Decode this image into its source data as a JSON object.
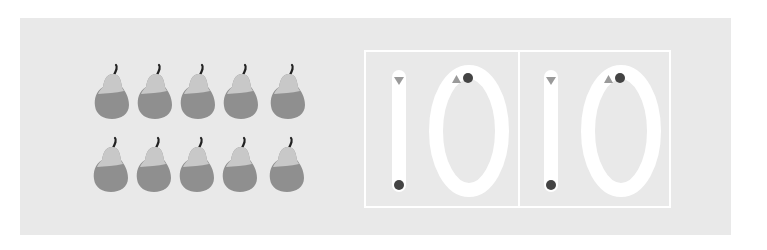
{
  "activity": {
    "type": "counting-and-tracing-worksheet",
    "object_name": "pear",
    "count": 10,
    "rows": 2,
    "per_row": 5,
    "trace_number": "10",
    "trace_cells": [
      {
        "digits": [
          "1",
          "0"
        ]
      },
      {
        "digits": [
          "1",
          "0"
        ]
      }
    ]
  },
  "colors": {
    "background": "#ffffff",
    "panel": "#e9e9e9",
    "trace_stroke": "#ffffff",
    "pear_body": "#8f8f8f",
    "pear_highlight": "#c8c8c8",
    "stem": "#222222",
    "start_triangle": "#9a9a9a",
    "end_dot": "#444444"
  },
  "icons": {
    "object": "pear-icon",
    "start_marker": "triangle-icon",
    "end_marker": "dot-icon"
  }
}
